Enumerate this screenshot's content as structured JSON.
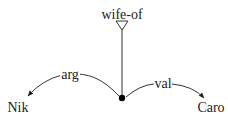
{
  "diagram": {
    "root": {
      "label": "wife-of",
      "icon": "triangle-down-icon"
    },
    "center_node": {
      "icon": "filled-dot-icon"
    },
    "edges": [
      {
        "label": "arg",
        "target": "Nik"
      },
      {
        "label": "val",
        "target": "Caro"
      }
    ],
    "nodes": {
      "left": "Nik",
      "right": "Caro"
    },
    "colors": {
      "stroke": "#333333",
      "text": "#222222",
      "background": "#ffffff"
    }
  }
}
